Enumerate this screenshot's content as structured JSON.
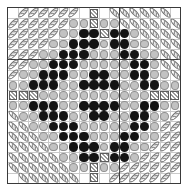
{
  "figure": {
    "title": "",
    "background_color": "#ffffff",
    "frame_color": "#3a3a3a",
    "gridline_color": "#c9c9c9"
  },
  "legend": {
    "symbols": [
      {
        "key": "black",
        "name": "filled-black-circle",
        "color": "#141414"
      },
      {
        "key": "gray",
        "name": "light-gray-circle",
        "color": "#c2c2c2"
      },
      {
        "key": "hatch",
        "name": "diagonal-hatched-ellipse",
        "color": "#8e8e8e"
      },
      {
        "key": "cross",
        "name": "crosshatched-square",
        "color": "#9a9a9a"
      },
      {
        "key": "empty",
        "name": "blank-cell",
        "color": "#ffffff"
      }
    ]
  },
  "chart_data": {
    "type": "heatmap",
    "title": "",
    "xlabel": "",
    "ylabel": "",
    "rows": 17,
    "cols": 17,
    "xlim": [
      0,
      17
    ],
    "ylim": [
      0,
      17
    ],
    "grid": true,
    "legend_position": "none",
    "axis_lines": {
      "vertical_at_col": 11,
      "horizontal_at_row": 5
    },
    "tick_labels_x": [],
    "tick_labels_y": [],
    "symbol_map": {
      "h": "diagonal-hatched-ellipse",
      "x": "crosshatched-square",
      "g": "light-gray-circle",
      "b": "filled-black-circle",
      ".": "blank-cell"
    },
    "matrix": [
      ". h h h h h h . x . h h h h h h .",
      "h h h h h h g g x g g h h h h h h",
      "h h h h h g g b b x b b g h h h h",
      "h h h h g g b b b g b b g g h h h",
      "h h h g g b b b g g g b b g g h h",
      "h h g g b b b g g g g g b b g h h",
      "h g g b b b g g b b g g b b g g h",
      "g g b b b g g b b b b g g b b g g",
      "x x x g g g g g g g g g g g x x x",
      "g g b b b g g b b b b g g b b g g",
      "h g g b b b g g b b g g b b g g h",
      "h h g g b b b g g g g g b b g h h",
      "h h h g g b b b g g g b b g g h h",
      "h h h h g g b b b g b b g g h h h",
      "h h h h h g g b b x b b g h h h h",
      "h h h h h h g g x g g h h h h h h",
      ". h h h h h h . x . h h h h h h ."
    ]
  }
}
